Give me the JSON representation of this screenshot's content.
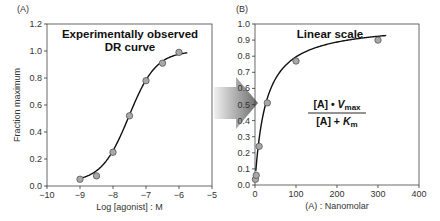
{
  "chart_data": [
    {
      "type": "scatter",
      "panel_label": "(A)",
      "title": "Experimentally observed\nDR curve",
      "title_lines": [
        "Experimentally observed",
        "DR curve"
      ],
      "xlabel": "Log [agonist] : M",
      "ylabel": "Fraction maximum",
      "xlim": [
        -10,
        -5
      ],
      "ylim": [
        0,
        1.2
      ],
      "xticks": [
        "-10",
        "-9",
        "-8",
        "-7",
        "-6",
        "-5"
      ],
      "yticks": [
        "0.0",
        "0.2",
        "0.4",
        "0.6",
        "0.8",
        "1.0",
        "1.2"
      ],
      "grid": false,
      "fit": "sigmoid",
      "x": [
        -9,
        -8.5,
        -8,
        -7.5,
        -7,
        -6.5,
        -6
      ],
      "y": [
        0.05,
        0.075,
        0.25,
        0.52,
        0.78,
        0.91,
        0.99
      ]
    },
    {
      "type": "scatter",
      "panel_label": "(B)",
      "title": "Linear scale",
      "xlabel": "(A) : Nanomolar",
      "ylabel": "",
      "xlim": [
        0,
        400
      ],
      "ylim": [
        0,
        1.0
      ],
      "xticks": [
        "0",
        "100",
        "200",
        "300",
        "400"
      ],
      "yticks": [
        "0.0",
        "0.1",
        "0.2",
        "0.3",
        "0.4",
        "0.5",
        "0.6",
        "0.7",
        "0.8",
        "0.9",
        "1.0"
      ],
      "grid": false,
      "fit": "hyperbola",
      "annotation": {
        "numerator": "[A] • Vmax",
        "denominator": "[A] + Km"
      },
      "x": [
        1,
        3,
        10,
        30,
        100,
        300
      ],
      "y": [
        0.035,
        0.06,
        0.24,
        0.51,
        0.77,
        0.9
      ]
    }
  ],
  "arrow": {
    "direction": "right",
    "meaning": "log-to-linear transform"
  },
  "colors": {
    "marker_fill": "#a8a8a8",
    "marker_stroke": "#555555",
    "curve": "#111111",
    "axis": "#333333"
  }
}
